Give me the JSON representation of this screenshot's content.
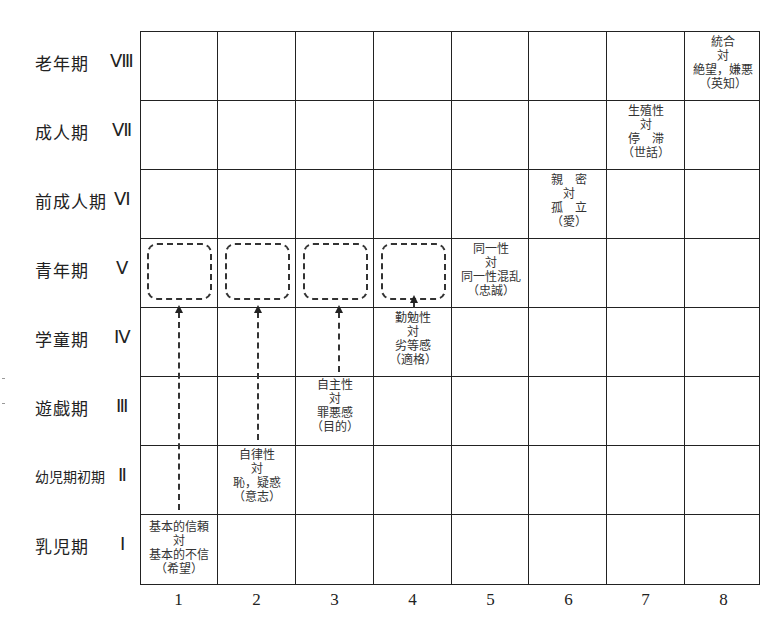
{
  "rows": [
    {
      "stage": "老年期",
      "roman": "Ⅷ"
    },
    {
      "stage": "成人期",
      "roman": "Ⅶ"
    },
    {
      "stage": "前成人期",
      "roman": "Ⅵ"
    },
    {
      "stage": "青年期",
      "roman": "Ⅴ"
    },
    {
      "stage": "学童期",
      "roman": "Ⅳ"
    },
    {
      "stage": "遊戯期",
      "roman": "Ⅲ"
    },
    {
      "stage": "幼児期初期",
      "roman": "Ⅱ"
    },
    {
      "stage": "乳児期",
      "roman": "Ⅰ"
    }
  ],
  "columns": [
    "1",
    "2",
    "3",
    "4",
    "5",
    "6",
    "7",
    "8"
  ],
  "crises": [
    {
      "row": "Ⅰ",
      "col": 1,
      "text": "基本的信頼\n対\n基本的不信\n（希望）"
    },
    {
      "row": "Ⅱ",
      "col": 2,
      "text": "自律性\n対\n恥，疑惑\n（意志）"
    },
    {
      "row": "Ⅲ",
      "col": 3,
      "text": "自主性\n対\n罪悪感\n（目的）"
    },
    {
      "row": "Ⅳ",
      "col": 4,
      "text": "勤勉性\n対\n劣等感\n（適格）"
    },
    {
      "row": "Ⅴ",
      "col": 5,
      "text": "同一性\n対\n同一性混乱\n（忠誠）"
    },
    {
      "row": "Ⅵ",
      "col": 6,
      "text": "親　密\n対\n孤　立\n（愛）"
    },
    {
      "row": "Ⅶ",
      "col": 7,
      "text": "生殖性\n対\n停　滞\n（世話）"
    },
    {
      "row": "Ⅷ",
      "col": 8,
      "text": "統合\n対\n絶望，嫌悪\n（英知）"
    }
  ],
  "dashed_boxes": [
    {
      "row": "Ⅴ",
      "col": 1
    },
    {
      "row": "Ⅴ",
      "col": 2
    },
    {
      "row": "Ⅴ",
      "col": 3
    },
    {
      "row": "Ⅴ",
      "col": 4
    }
  ]
}
